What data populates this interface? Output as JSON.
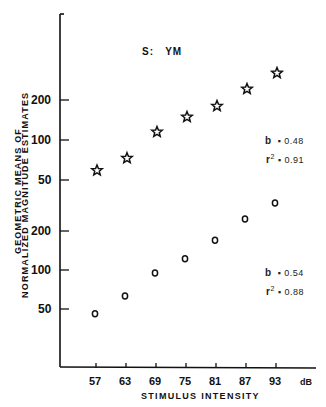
{
  "chart_data": {
    "type": "scatter",
    "subject_label": "S:",
    "subject_id": "YM",
    "xlabel": "STIMULUS INTENSITY",
    "x_unit": "dB",
    "ylabel_line1": "GEOMETRIC MEANS OF",
    "ylabel_line2": "NORMALIZED MAGNITUDE ESTIMATES",
    "y_scale": "log",
    "categories": [
      "57",
      "63",
      "69",
      "75",
      "81",
      "87",
      "93"
    ],
    "x": [
      57,
      63,
      69,
      75,
      81,
      87,
      93
    ],
    "upper_y_ticks": [
      "200",
      "100",
      "50"
    ],
    "lower_y_ticks": [
      "200",
      "100",
      "50"
    ],
    "series": [
      {
        "name": "stars (upper panel)",
        "marker": "star",
        "values": [
          59,
          73,
          115,
          149,
          180,
          242,
          319
        ],
        "fit": {
          "b_label": "b",
          "b": "0.48",
          "r2_label": "r",
          "r2_sup": "2",
          "r2": "0.91"
        }
      },
      {
        "name": "circles (lower panel)",
        "marker": "circle",
        "values": [
          46,
          63,
          95,
          122,
          170,
          247,
          329
        ],
        "fit": {
          "b_label": "b",
          "b": "0.54",
          "r2_label": "r",
          "r2_sup": "2",
          "r2": "0.88"
        }
      }
    ],
    "grid": false,
    "legend": "none"
  }
}
